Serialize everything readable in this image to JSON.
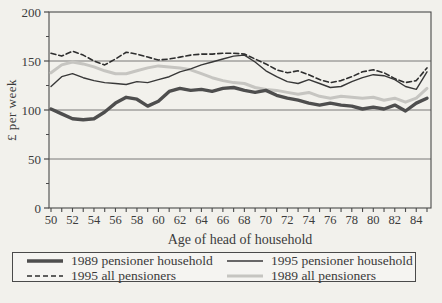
{
  "figure": {
    "kind": "scanned line chart",
    "background": "#f2f1ec",
    "ink_color": "#3a3a3a"
  },
  "chart_data": {
    "type": "line",
    "title": "",
    "xlabel": "Age of head of household",
    "ylabel": "£ per week",
    "ylim": [
      0,
      200
    ],
    "yticks": [
      0,
      50,
      100,
      150,
      200
    ],
    "y_minor_step": 25,
    "grid": "horizontal lines at 50, 100, 150",
    "legend_position": "bottom box, 2 columns",
    "x": [
      50,
      51,
      52,
      53,
      54,
      55,
      56,
      57,
      58,
      59,
      60,
      61,
      62,
      63,
      64,
      65,
      66,
      67,
      68,
      69,
      70,
      71,
      72,
      73,
      74,
      75,
      76,
      77,
      78,
      79,
      80,
      81,
      82,
      83,
      84,
      85
    ],
    "xtick_labels": [
      50,
      52,
      54,
      56,
      58,
      60,
      62,
      64,
      66,
      68,
      70,
      72,
      74,
      76,
      78,
      80,
      82,
      84
    ],
    "series": [
      {
        "name": "1989 pensioner households",
        "style": "thick-solid",
        "color": "#4e4e4e",
        "width": 3.4,
        "dash": "",
        "values": [
          101,
          96,
          91,
          90,
          91,
          98,
          107,
          113,
          111,
          104,
          109,
          119,
          122,
          120,
          121,
          119,
          122,
          123,
          120,
          118,
          120,
          115,
          112,
          110,
          107,
          105,
          107,
          105,
          104,
          101,
          103,
          101,
          105,
          99,
          107,
          112
        ]
      },
      {
        "name": "1995 pensioner households",
        "style": "thin-solid",
        "color": "#383838",
        "width": 1.4,
        "dash": "",
        "values": [
          124,
          134,
          137,
          133,
          130,
          128,
          127,
          126,
          129,
          128,
          131,
          134,
          139,
          142,
          146,
          149,
          152,
          155,
          156,
          149,
          140,
          134,
          129,
          127,
          131,
          127,
          123,
          124,
          129,
          133,
          136,
          135,
          131,
          124,
          121,
          139
        ]
      },
      {
        "name": "1989 all pensioners",
        "style": "light-solid",
        "color": "#c6c5c1",
        "width": 3,
        "dash": "",
        "values": [
          138,
          146,
          149,
          147,
          144,
          140,
          137,
          137,
          140,
          143,
          145,
          144,
          143,
          141,
          137,
          133,
          130,
          128,
          127,
          123,
          121,
          120,
          118,
          116,
          118,
          114,
          112,
          114,
          113,
          112,
          113,
          110,
          112,
          108,
          112,
          122
        ]
      },
      {
        "name": "1995 all pensioners",
        "style": "dashed",
        "color": "#2e2e2e",
        "width": 1.6,
        "dash": "5,3",
        "values": [
          158,
          155,
          160,
          156,
          150,
          146,
          152,
          159,
          157,
          154,
          151,
          152,
          154,
          156,
          157,
          157,
          158,
          158,
          157,
          152,
          147,
          141,
          138,
          140,
          136,
          131,
          128,
          130,
          134,
          139,
          141,
          138,
          132,
          128,
          130,
          143
        ]
      }
    ],
    "legend_order": [
      0,
      1,
      3,
      2
    ],
    "legend_rows": [
      [
        "1989 pensioner households",
        "1995 pensioner households"
      ],
      [
        "1989 all pensioners",
        "1995 all pensioners"
      ]
    ]
  }
}
